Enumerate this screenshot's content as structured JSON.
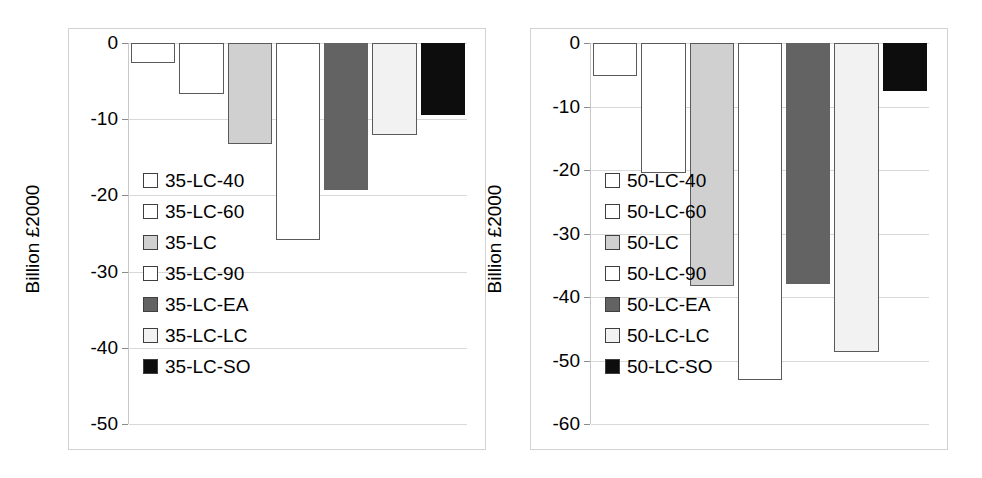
{
  "figure": {
    "background": "#ffffff",
    "panel_border_color": "#d2d2d2",
    "gridline_color": "#d9d9d9",
    "bar_outline_color": "#5a5a5a"
  },
  "palette": {
    "white": "#ffffff",
    "light_gray": "#d0d0d0",
    "off_white": "#f2f2f2",
    "dark_gray": "#636363",
    "black": "#0d0d0d"
  },
  "chart_data": [
    {
      "id": "left",
      "type": "bar",
      "title": "",
      "xlabel": "",
      "ylabel": "Billion £2000",
      "ylim": [
        -50,
        0
      ],
      "yticks": [
        0,
        -10,
        -20,
        -30,
        -40,
        -50
      ],
      "ytick_labels": [
        "0",
        "-10",
        "-20",
        "-30",
        "-40",
        "-50"
      ],
      "grid": true,
      "legend_position": "inside-left",
      "categories": [
        "35-LC-40",
        "35-LC-60",
        "35-LC",
        "35-LC-90",
        "35-LC-EA",
        "35-LC-LC",
        "35-LC-SO"
      ],
      "values": [
        -2.6,
        -6.7,
        -13.2,
        -25.8,
        -19.3,
        -12.1,
        -9.4
      ],
      "colors": [
        "#ffffff",
        "#ffffff",
        "#d0d0d0",
        "#ffffff",
        "#636363",
        "#f2f2f2",
        "#0d0d0d"
      ]
    },
    {
      "id": "right",
      "type": "bar",
      "title": "",
      "xlabel": "",
      "ylabel": "Billion £2000",
      "ylim": [
        -60,
        0
      ],
      "yticks": [
        0,
        -10,
        -20,
        -30,
        -40,
        -50,
        -60
      ],
      "ytick_labels": [
        "0",
        "-10",
        "-20",
        "-30",
        "-40",
        "-50",
        "-60"
      ],
      "grid": true,
      "legend_position": "inside-left",
      "categories": [
        "50-LC-40",
        "50-LC-60",
        "50-LC",
        "50-LC-90",
        "50-LC-EA",
        "50-LC-LC",
        "50-LC-SO"
      ],
      "values": [
        -5.2,
        -20.5,
        -38.2,
        -53.0,
        -38.0,
        -48.6,
        -7.6
      ],
      "colors": [
        "#ffffff",
        "#ffffff",
        "#d0d0d0",
        "#ffffff",
        "#636363",
        "#f2f2f2",
        "#0d0d0d"
      ]
    }
  ]
}
